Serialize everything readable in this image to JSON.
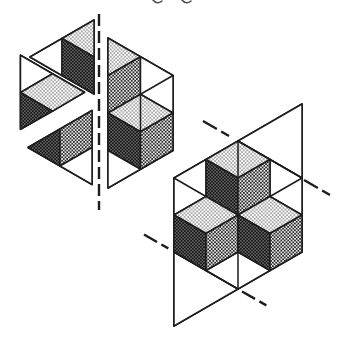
{
  "figure": {
    "canvas": {
      "width": 338,
      "height": 347
    },
    "ink": "#1d1d1d",
    "background": "#ffffff",
    "shades": {
      "light": "#e4e4e4",
      "medium": "#9c9c9c",
      "dark": "#2a2a2a"
    },
    "text_fragments": [
      {
        "name": "cropped-text-descender-1",
        "d": "M 153 0 q 4 5 9 1"
      },
      {
        "name": "cropped-text-descender-2",
        "d": "M 182 0 q 4 5 9 1"
      }
    ],
    "groups": [
      {
        "name": "left-figure-exploded-hexagon",
        "faces": [
          {
            "name": "piece-a-outline",
            "fill": "none",
            "w": 1.8,
            "pts": "30,57 94,20 94,94"
          },
          {
            "name": "piece-a-white-triangle",
            "fill": "white",
            "pts": "30,57 62,38.5 62,75.5"
          },
          {
            "name": "piece-a-light-top-triangle",
            "fill": "light",
            "pts": "94,20 62,38.5 94,57"
          },
          {
            "name": "piece-a-dark-left-face",
            "fill": "dark",
            "pts": "62,38.5 94,57 94,94 62,75.5"
          },
          {
            "name": "piece-b-outline",
            "fill": "none",
            "w": 1.8,
            "pts": "20.5,55.25 84.5,92.25 20.5,129.25"
          },
          {
            "name": "piece-b-white-triangle",
            "fill": "white",
            "pts": "20.5,55.25 52.5,73.75 20.5,92.5"
          },
          {
            "name": "piece-b-light-top-rhombus",
            "fill": "light",
            "pts": "52.5,73.75 84.5,92.25 52.5,111.25 20.5,92.5"
          },
          {
            "name": "piece-b-dark-left-triangle",
            "fill": "dark",
            "pts": "20.5,92.5 52.5,111.25 20.5,129.25"
          },
          {
            "name": "piece-c-outline",
            "fill": "none",
            "w": 1.8,
            "pts": "28,147.5 92,110.5 92,184.5"
          },
          {
            "name": "piece-c-dark-left-triangle",
            "fill": "dark",
            "pts": "28,147.5 60,129 60,166"
          },
          {
            "name": "piece-c-medium-right-face",
            "fill": "medium",
            "pts": "60,129 92,110.5 92,147.5 60,166"
          },
          {
            "name": "piece-c-white-triangle",
            "fill": "white",
            "pts": "60,166 92,147.5 92,184.5"
          },
          {
            "name": "half-hexagon-outline",
            "fill": "none",
            "w": 1.8,
            "pts": "108,38 173,75.5 173,150.5 108,188"
          },
          {
            "name": "half-hexagon-light-top-triangle",
            "fill": "light",
            "pts": "108,38 140.5,56.75 108,75.5"
          },
          {
            "name": "half-hexagon-medium-right-face",
            "fill": "medium",
            "pts": "108,75.5 140.5,56.75 140.5,94.25 108,113"
          },
          {
            "name": "half-hexagon-white-quad",
            "fill": "white",
            "pts": "140.5,56.75 173,75.5 173,113 140.5,94.25"
          },
          {
            "name": "half-hexagon-light-top-rhombus",
            "fill": "light",
            "pts": "108,113 140.5,94.25 173,113 140.5,131.75"
          },
          {
            "name": "half-hexagon-dark-left-face",
            "fill": "dark",
            "pts": "108,113 140.5,131.75 140.5,169.25 108,150.5"
          },
          {
            "name": "half-hexagon-medium-right-face-2",
            "fill": "medium",
            "pts": "140.5,131.75 173,113 173,150.5 140.5,169.25"
          },
          {
            "name": "half-hexagon-white-triangle",
            "fill": "white",
            "pts": "108,150.5 140.5,169.25 108,188"
          }
        ],
        "lines": [
          {
            "name": "half-hexagon-grid-diagonal",
            "x1": 140.5,
            "y1": 94.25,
            "x2": 173,
            "y2": 75.5
          },
          {
            "name": "half-hexagon-rhombus-divider",
            "x1": 140.5,
            "y1": 94.25,
            "x2": 140.5,
            "y2": 131.75
          }
        ],
        "dashed_lines": [
          {
            "name": "mirror-axis-dashed-line",
            "x1": 99,
            "y1": 14,
            "x2": 99,
            "y2": 210,
            "dash": "12 5",
            "w": 2.4
          }
        ]
      },
      {
        "name": "right-figure-unit-cell",
        "faces": [
          {
            "name": "parallelogram-outline",
            "fill": "none",
            "w": 1.9,
            "pts": "174,178 302,104 302,252 174,326"
          },
          {
            "name": "white-triangle-top-right",
            "fill": "white",
            "pts": "238,141 302,104 302,178"
          },
          {
            "name": "white-triangle-bottom-left",
            "fill": "white",
            "pts": "174,252 238,289 174,326"
          },
          {
            "name": "white-quad-upper-left",
            "fill": "white",
            "pts": "174,178 206,159.5 206,196.5 174,215"
          },
          {
            "name": "white-quad-upper-right",
            "fill": "white",
            "pts": "270,159.5 302,178 302,215 270,196.5"
          },
          {
            "name": "white-bottom-rhombus",
            "fill": "white",
            "pts": "206,270.5 238,252 270,270.5 238,289"
          },
          {
            "name": "top-cube-top-face",
            "fill": "light",
            "pts": "238,141 270,159.5 238,178 206,159.5"
          },
          {
            "name": "top-cube-left-face",
            "fill": "dark",
            "pts": "206,159.5 238,178 238,215 206,196.5"
          },
          {
            "name": "top-cube-right-face",
            "fill": "medium",
            "pts": "238,178 270,159.5 270,196.5 238,215"
          },
          {
            "name": "left-cube-top-face",
            "fill": "light",
            "pts": "206,196.5 238,215 206,233.5 174,215"
          },
          {
            "name": "left-cube-left-face",
            "fill": "dark",
            "pts": "174,215 206,233.5 206,270.5 174,252"
          },
          {
            "name": "left-cube-right-face",
            "fill": "medium",
            "pts": "206,233.5 238,215 238,252 206,270.5"
          },
          {
            "name": "right-cube-top-face",
            "fill": "light",
            "pts": "270,196.5 302,215 270,233.5 238,215"
          },
          {
            "name": "right-cube-left-face",
            "fill": "dark",
            "pts": "238,215 270,233.5 270,270.5 238,252"
          },
          {
            "name": "right-cube-right-face",
            "fill": "medium",
            "pts": "270,233.5 302,215 302,252 270,270.5"
          }
        ],
        "lines": [
          {
            "name": "hexagon-edge-top-right",
            "x1": 238,
            "y1": 141,
            "x2": 302,
            "y2": 178
          },
          {
            "name": "hexagon-edge-bottom-left",
            "x1": 174,
            "y1": 252,
            "x2": 238,
            "y2": 289
          },
          {
            "name": "vertical-diameter-top",
            "x1": 238,
            "y1": 141,
            "x2": 238,
            "y2": 178
          },
          {
            "name": "vertical-diameter-bottom",
            "x1": 238,
            "y1": 252,
            "x2": 238,
            "y2": 289
          },
          {
            "name": "white-quad-nw-divider",
            "x1": 174,
            "y1": 178,
            "x2": 206,
            "y2": 196.5
          },
          {
            "name": "white-quad-ne-divider",
            "x1": 302,
            "y1": 178,
            "x2": 270,
            "y2": 196.5
          }
        ],
        "dashed_lines": [
          {
            "name": "glide-axis-dash-top-left",
            "x1": 203,
            "y1": 121,
            "x2": 236,
            "y2": 140,
            "dash": "16 5 9 60",
            "w": 2.4
          },
          {
            "name": "glide-axis-dash-right",
            "x1": 304,
            "y1": 180,
            "x2": 336,
            "y2": 198.5,
            "dash": "16 5 9 60",
            "w": 2.4
          },
          {
            "name": "glide-axis-dash-left",
            "x1": 144,
            "y1": 234.5,
            "x2": 172,
            "y2": 250.5,
            "dash": "15 5 8 60",
            "w": 2.4
          },
          {
            "name": "glide-axis-dash-bottom",
            "x1": 242,
            "y1": 291.5,
            "x2": 271,
            "y2": 308,
            "dash": "15 5 8 60",
            "w": 2.4
          }
        ]
      }
    ]
  }
}
